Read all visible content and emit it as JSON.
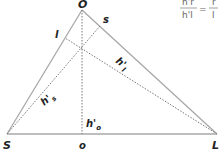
{
  "diagram": {
    "type": "triangle-altitudes",
    "colors": {
      "edge": "#a8a8a8",
      "altitude": "#777777",
      "label": "#222222",
      "formula": "#666666"
    },
    "vertices": {
      "O": {
        "label": "O",
        "x": 82,
        "y": 10
      },
      "S": {
        "label": "S",
        "x": 7,
        "y": 134
      },
      "L": {
        "label": "L",
        "x": 217,
        "y": 134
      }
    },
    "feet": {
      "o": {
        "label": "o",
        "x": 82,
        "y": 134
      },
      "s": {
        "label": "s",
        "x": 100,
        "y": 26
      },
      "l": {
        "label": "l",
        "x": 65,
        "y": 38
      }
    },
    "altitude_labels": {
      "h_l": {
        "base": "h'",
        "sub": "l"
      },
      "h_s": {
        "base": "h'",
        "sub": "s"
      },
      "h_o": {
        "base": "h'",
        "sub": "o"
      }
    },
    "formula": {
      "numerator_left": "h'r",
      "denominator_left": "h'l",
      "equals": "=",
      "numerator_right": "r",
      "denominator_right": "l"
    }
  }
}
